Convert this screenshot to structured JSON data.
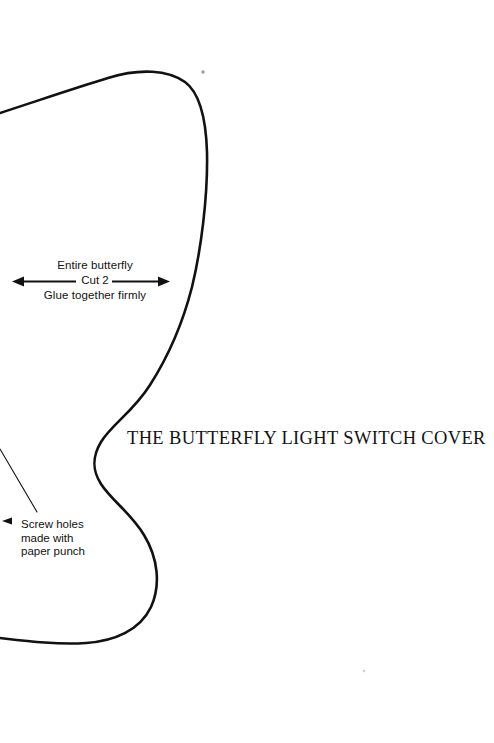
{
  "page": {
    "kind": "craft-pattern-template",
    "width": 494,
    "height": 743,
    "background_color": "#ffffff",
    "ink_color": "#111111"
  },
  "title": {
    "text": "THE BUTTERFLY LIGHT SWITCH COVER"
  },
  "annotations": {
    "cut_instruction": {
      "line1": "Entire butterfly",
      "line2": "Cut 2",
      "line3": "Glue together firmly",
      "arrow": {
        "name": "double-headed-arrow",
        "direction": "both",
        "x_start": 12,
        "x_end": 170,
        "y": 281
      }
    },
    "screw_note": {
      "line1": "Screw holes",
      "line2": "made with",
      "line3": "paper punch",
      "arrow": {
        "name": "left-arrowhead",
        "direction": "left",
        "x": 2,
        "y": 521
      },
      "leader_line": {
        "name": "screw-hole-leader-line",
        "x1": 0,
        "y1": 449,
        "x2": 37,
        "y2": 512
      }
    }
  },
  "shapes": {
    "butterfly_outline": {
      "name": "butterfly-wing-outline",
      "stroke": "#111111",
      "description": "Half butterfly wing silhouette, open curve from left edge over the top, down the right of the wing, inward to the body notch, then out and down around the lower wing back to the left edge."
    },
    "specks": [
      {
        "name": "paper-speck-top",
        "x": 203,
        "y": 72,
        "r": 1.7,
        "color": "#9a9a9a"
      },
      {
        "name": "paper-speck-bottom",
        "x": 364,
        "y": 671,
        "r": 1.3,
        "color": "#cfcfcf"
      }
    ]
  }
}
